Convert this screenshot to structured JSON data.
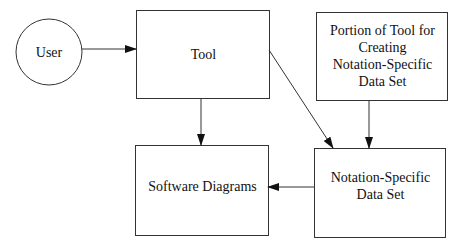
{
  "diagram": {
    "nodes": [
      {
        "id": "user",
        "label": "User",
        "shape": "circle"
      },
      {
        "id": "tool",
        "label": "Tool",
        "shape": "rect"
      },
      {
        "id": "portion",
        "label": "Portion of Tool for Creating Notation-Specific Data Set",
        "shape": "rect"
      },
      {
        "id": "software_diagrams",
        "label": "Software Diagrams",
        "shape": "rect"
      },
      {
        "id": "notation_data",
        "label": "Notation-Specific Data Set",
        "shape": "rect"
      }
    ],
    "edges": [
      {
        "from": "user",
        "to": "tool"
      },
      {
        "from": "tool",
        "to": "software_diagrams"
      },
      {
        "from": "tool",
        "to": "notation_data"
      },
      {
        "from": "portion",
        "to": "notation_data"
      },
      {
        "from": "notation_data",
        "to": "software_diagrams"
      }
    ],
    "labels": {
      "user": "User",
      "tool": "Tool",
      "portion_line1": "Portion of Tool for",
      "portion_line2": "Creating",
      "portion_line3": "Notation-Specific",
      "portion_line4": "Data Set",
      "software_diagrams": "Software Diagrams",
      "notation_line1": "Notation-Specific",
      "notation_line2": "Data Set"
    },
    "colors": {
      "stroke": "#333333",
      "background": "#ffffff",
      "text": "#111111"
    }
  }
}
